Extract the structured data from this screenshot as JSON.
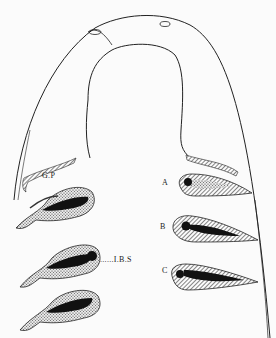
{
  "figure": {
    "labels": {
      "gp": "G.P",
      "ibs": "......I.B.S",
      "a": "A",
      "b": "B",
      "c": "C"
    },
    "colors": {
      "line": "#222222",
      "fill_dark": "#111111",
      "background": "#fbfbfb"
    }
  }
}
